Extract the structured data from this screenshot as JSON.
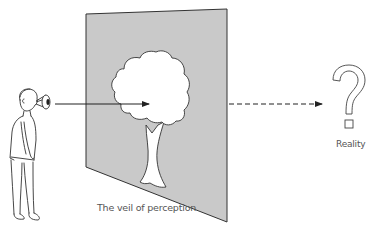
{
  "diagram": {
    "title": "The veil of perception",
    "labels": {
      "veil": "The veil of perception",
      "reality": "Reality"
    },
    "nodes": [
      {
        "id": "observer",
        "description": "Person with eye looking forward"
      },
      {
        "id": "veil",
        "description": "Grey screen panel in perspective showing image of a tree"
      },
      {
        "id": "tree-image",
        "description": "White tree silhouette on the veil"
      },
      {
        "id": "reality",
        "description": "Question mark representing unknown reality"
      }
    ],
    "edges": [
      {
        "from": "observer",
        "to": "tree-image",
        "style": "solid",
        "arrow": true
      },
      {
        "from": "veil",
        "to": "reality",
        "style": "dashed",
        "arrow": true
      }
    ],
    "colors": {
      "veil_fill": "#c8c8c8",
      "line": "#222222",
      "text": "#555555",
      "background": "#ffffff"
    }
  }
}
